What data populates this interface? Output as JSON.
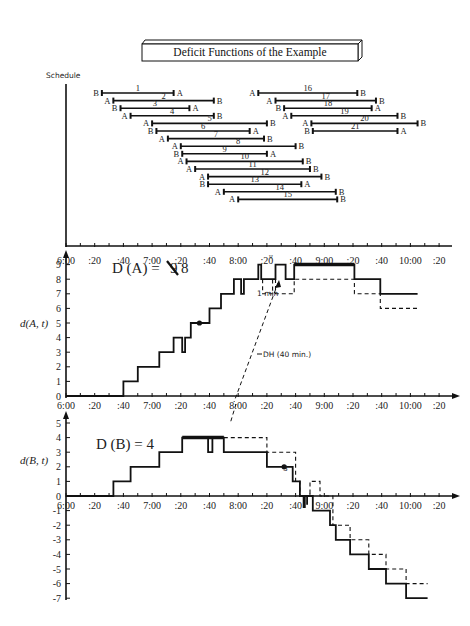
{
  "title": "Deficit Functions of the Example",
  "chart_data": [
    {
      "type": "gantt",
      "title": "Deficit Functions of the Example",
      "ylabel": "Schedule",
      "x_tick_labels": [
        "6:00",
        ":20",
        ":40",
        "7:00",
        ":20",
        ":40",
        "8:00",
        ":20",
        ":40",
        "9:00",
        ":20",
        ":40",
        "10:00",
        ":20"
      ],
      "trips": [
        {
          "id": "1",
          "start_min": 25,
          "end_min": 75,
          "from": "B",
          "to": "A"
        },
        {
          "id": "2",
          "start_min": 33,
          "end_min": 103,
          "from": "A",
          "to": "B"
        },
        {
          "id": "3",
          "start_min": 38,
          "end_min": 86,
          "from": "B",
          "to": "A"
        },
        {
          "id": "4",
          "start_min": 45,
          "end_min": 103,
          "from": "A",
          "to": "B"
        },
        {
          "id": "5",
          "start_min": 60,
          "end_min": 140,
          "from": "A",
          "to": "B"
        },
        {
          "id": "6",
          "start_min": 63,
          "end_min": 128,
          "from": "B",
          "to": "A"
        },
        {
          "id": "7",
          "start_min": 71,
          "end_min": 138,
          "from": "A",
          "to": "B"
        },
        {
          "id": "8",
          "start_min": 80,
          "end_min": 160,
          "from": "A",
          "to": "B"
        },
        {
          "id": "9",
          "start_min": 81,
          "end_min": 140,
          "from": "B",
          "to": "A"
        },
        {
          "id": "10",
          "start_min": 84,
          "end_min": 165,
          "from": "A",
          "to": "B"
        },
        {
          "id": "11",
          "start_min": 90,
          "end_min": 170,
          "from": "A",
          "to": "B"
        },
        {
          "id": "12",
          "start_min": 99,
          "end_min": 178,
          "from": "A",
          "to": "B"
        },
        {
          "id": "13",
          "start_min": 99,
          "end_min": 164,
          "from": "B",
          "to": "A"
        },
        {
          "id": "14",
          "start_min": 110,
          "end_min": 188,
          "from": "A",
          "to": "B"
        },
        {
          "id": "15",
          "start_min": 120,
          "end_min": 189,
          "from": "A",
          "to": "B"
        },
        {
          "id": "16",
          "start_min": 134,
          "end_min": 203,
          "from": "A",
          "to": "B"
        },
        {
          "id": "17",
          "start_min": 146,
          "end_min": 216,
          "from": "A",
          "to": "B"
        },
        {
          "id": "18",
          "start_min": 152,
          "end_min": 213,
          "from": "B",
          "to": "A"
        },
        {
          "id": "19",
          "start_min": 157,
          "end_min": 231,
          "from": "A",
          "to": "B"
        },
        {
          "id": "20",
          "start_min": 171,
          "end_min": 245,
          "from": "A",
          "to": "B"
        },
        {
          "id": "21",
          "start_min": 172,
          "end_min": 231,
          "from": "B",
          "to": "A"
        }
      ]
    },
    {
      "type": "line",
      "step": true,
      "title": "D (A) = 9 8",
      "annotation_title": "D (A) =",
      "annotation_struck": "9",
      "annotation_value": "8",
      "ylabel": "d(A, t)",
      "ylim": [
        0,
        9
      ],
      "y_ticks": [
        0,
        1,
        2,
        3,
        4,
        5,
        6,
        7,
        8,
        9
      ],
      "x_tick_labels": [
        "6:00",
        ":20",
        ":40",
        "7:00",
        ":20",
        ":40",
        "8:00",
        ":20",
        ":40",
        "9:00",
        ":20",
        ":40",
        "10:00",
        ":20"
      ],
      "series": [
        {
          "name": "d(A,t) original",
          "style": "solid",
          "points": [
            [
              0,
              0
            ],
            [
              40,
              0
            ],
            [
              40,
              1
            ],
            [
              50,
              1
            ],
            [
              50,
              2
            ],
            [
              65,
              2
            ],
            [
              65,
              3
            ],
            [
              75,
              3
            ],
            [
              75,
              4
            ],
            [
              81,
              4
            ],
            [
              81,
              3
            ],
            [
              83,
              3
            ],
            [
              83,
              4
            ],
            [
              87,
              4
            ],
            [
              87,
              5
            ],
            [
              100,
              5
            ],
            [
              100,
              6
            ],
            [
              108,
              6
            ],
            [
              108,
              7
            ],
            [
              117,
              7
            ],
            [
              117,
              8
            ],
            [
              122,
              8
            ],
            [
              122,
              7
            ],
            [
              124,
              7
            ],
            [
              124,
              8
            ],
            [
              134,
              8
            ],
            [
              134,
              9
            ],
            [
              136,
              9
            ],
            [
              136,
              8
            ],
            [
              146,
              8
            ],
            [
              146,
              9
            ],
            [
              153,
              9
            ],
            [
              153,
              8
            ],
            [
              159,
              8
            ],
            [
              159,
              9
            ],
            [
              201,
              9
            ],
            [
              201,
              8
            ],
            [
              219,
              8
            ],
            [
              219,
              7
            ],
            [
              245,
              7
            ]
          ]
        },
        {
          "name": "d(A,t) with deadhead",
          "style": "dashed",
          "points": [
            [
              137,
              8
            ],
            [
              137,
              7
            ],
            [
              144,
              7
            ],
            [
              144,
              8
            ],
            [
              146,
              8
            ],
            [
              146,
              7
            ],
            [
              159,
              7
            ],
            [
              159,
              8
            ],
            [
              201,
              8
            ],
            [
              201,
              7
            ],
            [
              219,
              7
            ],
            [
              219,
              6
            ],
            [
              245,
              6
            ]
          ]
        }
      ],
      "markers": [
        {
          "x": 93,
          "y": 5,
          "shape": "dot"
        }
      ],
      "annotations": [
        {
          "text": "1 min",
          "x": 127,
          "y": 7.3
        },
        {
          "text": "DH (40 min.)",
          "x": 145,
          "y": 3.0
        }
      ]
    },
    {
      "type": "line",
      "step": true,
      "title": "D (B) = 4",
      "annotation_title": "D (B) = 4",
      "ylabel": "d(B, t)",
      "ylim": [
        -7,
        5
      ],
      "y_ticks": [
        5,
        4,
        3,
        2,
        1,
        0,
        -1,
        -2,
        -3,
        -4,
        -5,
        -6,
        -7
      ],
      "x_tick_labels": [
        "6:00",
        ":20",
        ":40",
        "7:00",
        ":20",
        ":40",
        "8:00",
        ":20",
        ":40",
        "9:00",
        ":20",
        ":40",
        "10:00",
        ":20"
      ],
      "series": [
        {
          "name": "d(B,t) original",
          "style": "solid",
          "points": [
            [
              0,
              0
            ],
            [
              33,
              0
            ],
            [
              33,
              1
            ],
            [
              45,
              1
            ],
            [
              45,
              2
            ],
            [
              65,
              2
            ],
            [
              65,
              3
            ],
            [
              81,
              3
            ],
            [
              81,
              4
            ],
            [
              99,
              4
            ],
            [
              99,
              3
            ],
            [
              102,
              3
            ],
            [
              102,
              4
            ],
            [
              110,
              4
            ],
            [
              110,
              3
            ],
            [
              140,
              3
            ],
            [
              140,
              2
            ],
            [
              158,
              2
            ],
            [
              158,
              1
            ],
            [
              163,
              1
            ],
            [
              163,
              0
            ],
            [
              168,
              0
            ],
            [
              168,
              -0.6
            ],
            [
              168,
              0
            ],
            [
              172,
              0
            ],
            [
              172,
              -1
            ],
            [
              184,
              -1
            ],
            [
              184,
              -2
            ],
            [
              188,
              -2
            ],
            [
              188,
              -3
            ],
            [
              198,
              -3
            ],
            [
              198,
              -4
            ],
            [
              211,
              -4
            ],
            [
              211,
              -5
            ],
            [
              223,
              -5
            ],
            [
              223,
              -6
            ],
            [
              237,
              -6
            ],
            [
              237,
              -7
            ],
            [
              252,
              -7
            ]
          ]
        },
        {
          "name": "d(B,t) with deadhead",
          "style": "dashed",
          "points": [
            [
              110,
              4
            ],
            [
              140,
              4
            ],
            [
              140,
              3
            ],
            [
              160,
              3
            ],
            [
              160,
              1
            ],
            [
              163,
              1
            ],
            [
              163,
              0
            ],
            [
              170,
              0
            ],
            [
              170,
              1
            ],
            [
              177,
              1
            ],
            [
              177,
              0
            ],
            [
              186,
              0
            ],
            [
              186,
              -2
            ],
            [
              198,
              -2
            ],
            [
              198,
              -3
            ],
            [
              211,
              -3
            ],
            [
              211,
              -4
            ],
            [
              223,
              -4
            ],
            [
              223,
              -5
            ],
            [
              237,
              -5
            ],
            [
              237,
              -6
            ],
            [
              252,
              -6
            ]
          ]
        }
      ],
      "markers": [
        {
          "x": 152,
          "y": 2,
          "shape": "dot"
        }
      ],
      "annotations": [
        {
          "text": "3",
          "x": 150,
          "y": 3
        }
      ]
    }
  ],
  "labels": {
    "schedule_axis": "Schedule",
    "panel_a_ylabel": "d(A, t)",
    "panel_b_ylabel": "d(B, t)",
    "dA_prefix": "D (A) =",
    "dA_struck": "9",
    "dA_value": "8",
    "dB": "D (B) = 4",
    "one_min": "1 min",
    "dh": "DH (40 min.)",
    "b_three": "3"
  },
  "colors": {
    "ink": "#111111",
    "axis": "#1a1a1a",
    "background": "#ffffff"
  }
}
